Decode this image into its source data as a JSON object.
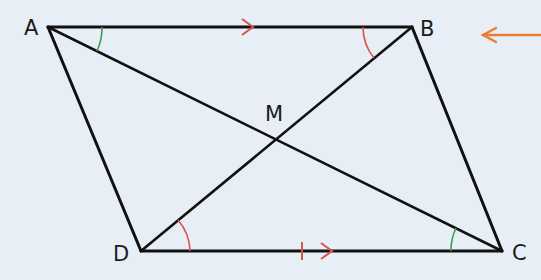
{
  "diagram": {
    "type": "parallelogram",
    "background": "#e8eef6",
    "line_color": "#111111",
    "colors": {
      "red": "#d9534a",
      "green": "#3e9a4a",
      "orange": "#ec7b35"
    },
    "vertices": {
      "A": {
        "label": "A",
        "x": 48,
        "y": 27
      },
      "B": {
        "label": "B",
        "x": 412,
        "y": 27
      },
      "C": {
        "label": "C",
        "x": 502,
        "y": 251
      },
      "D": {
        "label": "D",
        "x": 141,
        "y": 251
      }
    },
    "intersection": {
      "label": "M",
      "x": 278,
      "y": 140
    },
    "segments": [
      "AB",
      "BC",
      "CD",
      "DA",
      "AC",
      "BD"
    ],
    "parallel_marks": [
      "AB",
      "DC"
    ],
    "angle_marks": [
      {
        "vertex": "A",
        "color": "green",
        "between": [
          "AB",
          "AC"
        ]
      },
      {
        "vertex": "C",
        "color": "green",
        "between": [
          "CD",
          "CA"
        ]
      },
      {
        "vertex": "B",
        "color": "red",
        "between": [
          "BA",
          "BD"
        ]
      },
      {
        "vertex": "D",
        "color": "red",
        "between": [
          "DC",
          "DB"
        ]
      }
    ],
    "pointer_arrow": {
      "direction": "left",
      "color": "orange"
    }
  }
}
